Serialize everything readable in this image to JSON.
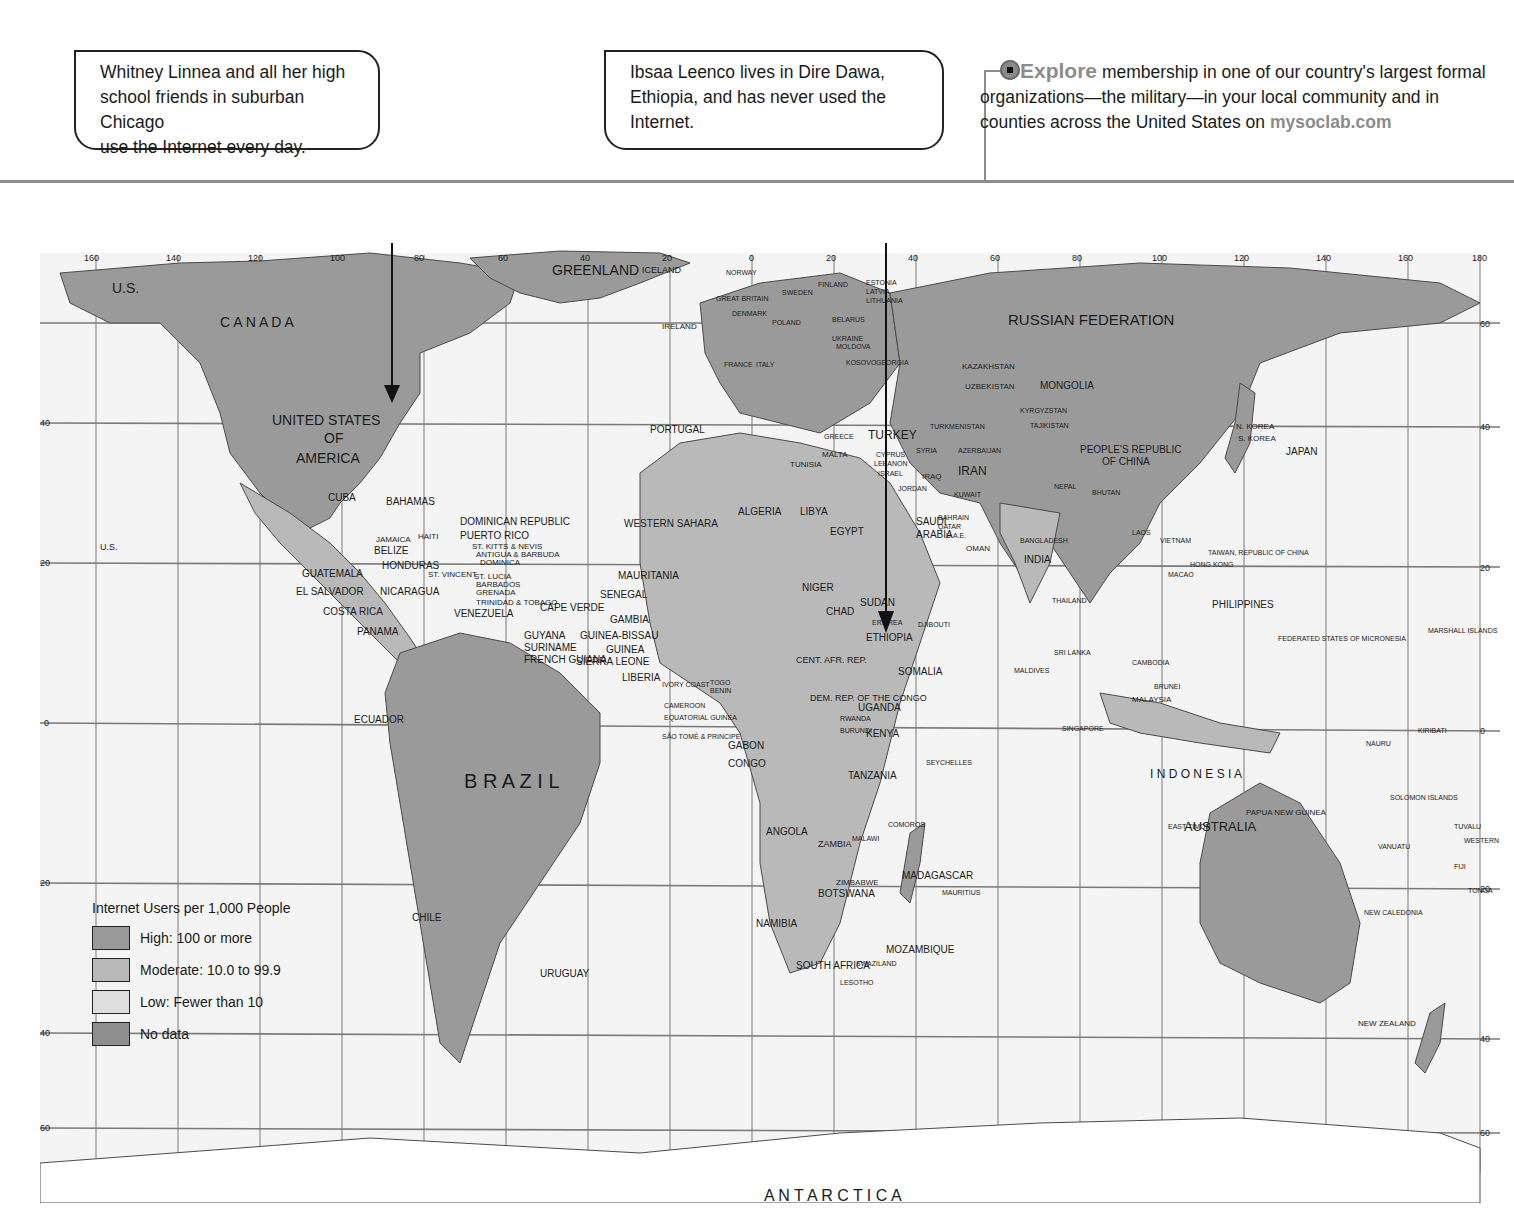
{
  "callouts": [
    {
      "id": "whitney",
      "lines": [
        "Whitney Linnea and all her high",
        "school friends in suburban Chicago",
        "use the Internet every day."
      ]
    },
    {
      "id": "ibsaa",
      "lines": [
        "Ibsaa Leenco lives in Dire Dawa,",
        "Ethiopia, and has never used the",
        "Internet."
      ]
    }
  ],
  "explore": {
    "keyword": "Explore",
    "text_1": " membership in one of our country's largest formal organizations—the military—in your local community and in counties across the United States on ",
    "url": "mysoclab.com",
    "icon": "target-icon"
  },
  "legend": {
    "title": "Internet Users per 1,000 People",
    "items": [
      {
        "label": "High: 100 or more",
        "color": "#9a9a9a"
      },
      {
        "label": "Moderate: 10.0 to 99.9",
        "color": "#b9b9b9"
      },
      {
        "label": "Low: Fewer than 10",
        "color": "#dedede"
      },
      {
        "label": "No data",
        "color": "#8e8e8e"
      }
    ]
  },
  "map": {
    "longitude_ticks_top": [
      "160",
      "140",
      "120",
      "100",
      "80",
      "60",
      "40",
      "20",
      "0",
      "20",
      "40",
      "60",
      "80",
      "100",
      "120",
      "140",
      "160",
      "180"
    ],
    "latitude_ticks": [
      "60",
      "40",
      "20",
      "0",
      "20",
      "40",
      "60"
    ],
    "colors": {
      "ocean": "#f4f4f4",
      "high": "#9a9a9a",
      "moderate": "#b9b9b9",
      "low": "#dedede",
      "grid": "#7a7a7a"
    },
    "labels": {
      "us_alaska": "U.S.",
      "canada": "C A N A D A",
      "usa_1": "UNITED STATES",
      "usa_2": "OF",
      "usa_3": "AMERICA",
      "us_hawaii": "U.S.",
      "mexico": "M E X I C O",
      "cuba": "CUBA",
      "bahamas": "BAHAMAS",
      "dominican": "DOMINICAN REPUBLIC",
      "puerto_rico": "PUERTO RICO",
      "haiti": "HAITI",
      "jamaica": "JAMAICA",
      "belize": "BELIZE",
      "st_kitts": "ST. KITTS & NEVIS",
      "antigua": "ANTIGUA & BARBUDA",
      "dominica": "DOMINICA",
      "guatemala": "GUATEMALA",
      "honduras": "HONDURAS",
      "st_vincent": "ST. VINCENT",
      "st_lucia": "ST. LUCIA",
      "barbados": "BARBADOS",
      "grenada": "GRENADA",
      "el_salvador": "EL SALVADOR",
      "nicaragua": "NICARAGUA",
      "trinidad": "TRINIDAD & TOBAGO",
      "costa_rica": "COSTA RICA",
      "panama": "PANAMA",
      "venezuela": "VENEZUELA",
      "guyana": "GUYANA",
      "suriname": "SURINAME",
      "french_guiana": "FRENCH GUIANA",
      "colombia": "COLOMBIA",
      "ecuador": "ECUADOR",
      "peru": "PERU",
      "brazil": "B R A Z I L",
      "bolivia": "BOLIVIA",
      "paraguay": "PARAGUAY",
      "chile": "CHILE",
      "argentina": "A R G E N T I N A",
      "uruguay": "URUGUAY",
      "greenland": "GREENLAND",
      "iceland": "ICELAND",
      "norway": "NORWAY",
      "sweden": "SWEDEN",
      "finland": "FINLAND",
      "estonia": "ESTONIA",
      "latvia": "LATVIA",
      "lithuania": "LITHUANIA",
      "great_britain": "GREAT BRITAIN",
      "denmark": "DENMARK",
      "ireland": "IRELAND",
      "neth": "NETH.",
      "germ": "GERM.",
      "poland": "POLAND",
      "belarus": "BELARUS",
      "bel": "BEL.",
      "lux": "LUX.",
      "czech": "CZECH REP.",
      "slov": "SLOV.",
      "ukraine": "UKRAINE",
      "moldova": "MOLDOVA",
      "switz": "SWITZ.",
      "aus": "AUS.",
      "hung": "HUNG.",
      "rom": "ROM.",
      "france": "FRANCE",
      "italy": "ITALY",
      "serbia": "SERBIA",
      "kosovo": "KOSOVO",
      "georgia": "GEORGIA",
      "mont": "MONT.",
      "bul": "BUL.",
      "slovenia": "SLOVENIA",
      "croatia": "CROATIA",
      "bosnia": "BOSNIA-HERZ.",
      "alb": "ALB.",
      "mace": "MACE.",
      "portugal": "PORTUGAL",
      "spain": "SPAIN",
      "greece": "GREECE",
      "turkey": "TURKEY",
      "armenia": "ARMENIA",
      "malta": "MALTA",
      "tunisia": "TUNISIA",
      "morocco": "MOROCCO",
      "algeria": "ALGERIA",
      "libya": "LIBYA",
      "egypt": "EGYPT",
      "western_sahara": "WESTERN SAHARA",
      "mauritania": "MAURITANIA",
      "mali": "M A L I",
      "niger": "NIGER",
      "chad": "CHAD",
      "sudan": "SUDAN",
      "eritrea": "ERITREA",
      "senegal": "SENEGAL",
      "cape_verde": "CAPE VERDE",
      "gambia": "GAMBIA",
      "guinea_bissau": "GUINEA-BISSAU",
      "guinea": "GUINEA",
      "sierra_leone": "SIERRA LEONE",
      "liberia": "LIBERIA",
      "burkina": "BURKINA FASO",
      "ghana": "GHANA",
      "nigeria": "NIGERIA",
      "ivory_coast": "IVORY COAST",
      "togo": "TOGO",
      "benin": "BENIN",
      "cameroon": "CAMEROON",
      "eq_guinea": "EQUATORIAL GUINEA",
      "sao_tome": "SÃO TOMÉ & PRINCIPE",
      "gabon": "GABON",
      "congo": "CONGO",
      "car": "CENT. AFR. REP.",
      "drc": "DEM. REP. OF THE CONGO",
      "uganda": "UGANDA",
      "kenya": "KENYA",
      "rwanda": "RWANDA",
      "burundi": "BURUNDI",
      "ethiopia": "ETHIOPIA",
      "somalia": "SOMALIA",
      "djibouti": "DJIBOUTI",
      "tanzania": "TANZANIA",
      "angola": "ANGOLA",
      "zambia": "ZAMBIA",
      "malawi": "MALAWI",
      "comoros": "COMOROS",
      "zimbabwe": "ZIMBABWE",
      "botswana": "BOTSWANA",
      "namibia": "NAMIBIA",
      "mozambique": "MOZAMBIQUE",
      "madagascar": "MADAGASCAR",
      "mauritius": "MAURITIUS",
      "swaziland": "SWAZILAND",
      "south_africa": "SOUTH AFRICA",
      "lesotho": "LESOTHO",
      "seychelles": "SEYCHELLES",
      "russia": "RUSSIAN   FEDERATION",
      "kazakhstan": "KAZAKHSTAN",
      "uzbekistan": "UZBEKISTAN",
      "kyrgyzstan": "KYRGYZSTAN",
      "tajikistan": "TAJIKISTAN",
      "turkmenistan": "TURKMENISTAN",
      "azerbaijan": "AZERBAIJAN",
      "mongolia": "MONGOLIA",
      "cyprus": "CYPRUS",
      "lebanon": "LEBANON",
      "israel": "ISRAEL",
      "syria": "SYRIA",
      "iraq": "IRAQ",
      "iran": "IRAN",
      "jordan": "JORDAN",
      "kuwait": "KUWAIT",
      "bahrain": "BAHRAIN",
      "qatar": "QATAR",
      "uae": "U.A.E.",
      "saudi_1": "SAUDI",
      "saudi_2": "ARABIA",
      "yemen": "YEMEN",
      "oman": "OMAN",
      "afghanistan": "AFGHANISTAN",
      "pakistan": "PAKISTAN",
      "china_1": "PEOPLE'S REPUBLIC",
      "china_2": "OF CHINA",
      "nepal": "NEPAL",
      "bhutan": "BHUTAN",
      "bangladesh": "BANGLADESH",
      "india": "INDIA",
      "myanmar": "MYANMAR",
      "laos": "LAOS",
      "vietnam": "VIETNAM",
      "taiwan": "TAIWAN, REPUBLIC OF CHINA",
      "hong_kong": "HONG KONG",
      "macao": "MACAO",
      "thailand": "THAILAND",
      "philippines": "PHILIPPINES",
      "sri_lanka": "SRI LANKA",
      "cambodia": "CAMBODIA",
      "maldives": "MALDIVES",
      "brunei": "BRUNEI",
      "malaysia": "MALAYSIA",
      "singapore": "SINGAPORE",
      "indonesia": "I N D O N E S I A",
      "east_timor": "EAST TIMOR",
      "png": "PAPUA NEW GUINEA",
      "n_korea": "N. KOREA",
      "s_korea": "S. KOREA",
      "japan": "JAPAN",
      "micronesia": "FEDERATED STATES OF MICRONESIA",
      "marshall": "MARSHALL ISLANDS",
      "kiribati": "KIRIBATI",
      "nauru": "NAURU",
      "solomon": "SOLOMON ISLANDS",
      "tuvalu": "TUVALU",
      "vanuatu": "VANUATU",
      "samoa": "WESTERN SAMOA",
      "fiji": "FIJI",
      "tonga": "TONGA",
      "new_caledonia": "NEW CALEDONIA",
      "australia": "AUSTRALIA",
      "new_zealand": "NEW ZEALAND",
      "antarctica": "A N T A R C T I C A"
    }
  }
}
